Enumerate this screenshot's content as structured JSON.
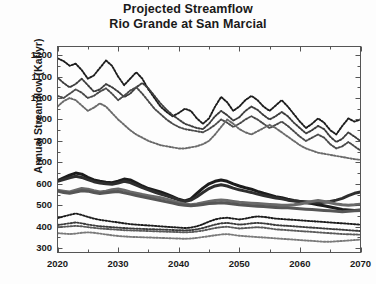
{
  "chart_data": {
    "type": "line",
    "title": "Projected Streamflow",
    "subtitle": "Rio Grande at San Marcial",
    "xlabel": "",
    "ylabel": "Annual Streamflow (Kaf/yr)",
    "xlim": [
      2020,
      2070
    ],
    "ylim": [
      280,
      1240
    ],
    "yticks": [
      300,
      400,
      500,
      600,
      700,
      800,
      900,
      1000,
      1100,
      1200
    ],
    "xticks": [
      2020,
      2030,
      2040,
      2050,
      2060,
      2070
    ],
    "xminor_step": 5,
    "grid": false,
    "legend": "none",
    "axis_frame": "box",
    "tick_direction": "in",
    "colors": {
      "background": "#fdfdfd",
      "axis": "#555555",
      "text": "#1a1a1a",
      "dark": "#1c1c1c",
      "mid_dark": "#3c3c3c",
      "mid": "#6a6a6a",
      "light": "#8e8e8e"
    },
    "x": [
      2020,
      2021,
      2022,
      2023,
      2024,
      2025,
      2026,
      2027,
      2028,
      2029,
      2030,
      2031,
      2032,
      2033,
      2034,
      2035,
      2036,
      2037,
      2038,
      2039,
      2040,
      2041,
      2042,
      2043,
      2044,
      2045,
      2046,
      2047,
      2048,
      2049,
      2050,
      2051,
      2052,
      2053,
      2054,
      2055,
      2056,
      2057,
      2058,
      2059,
      2060,
      2061,
      2062,
      2063,
      2064,
      2065,
      2066,
      2067,
      2068,
      2069,
      2070
    ],
    "series": [
      {
        "name": "upper-band-1",
        "group": "upper",
        "style": "dotted",
        "color": "#1c1c1c",
        "width": 1.9,
        "values": [
          1185,
          1172,
          1150,
          1160,
          1130,
          1090,
          1105,
          1140,
          1175,
          1150,
          1100,
          1060,
          1090,
          1120,
          1090,
          1040,
          1000,
          960,
          935,
          915,
          930,
          950,
          940,
          905,
          880,
          905,
          960,
          1005,
          980,
          940,
          960,
          990,
          1010,
          990,
          960,
          940,
          965,
          990,
          960,
          925,
          890,
          860,
          880,
          905,
          885,
          850,
          830,
          870,
          905,
          890,
          900
        ]
      },
      {
        "name": "upper-band-2",
        "group": "upper",
        "style": "dotted",
        "color": "#3c3c3c",
        "width": 1.9,
        "values": [
          1095,
          1070,
          1050,
          1065,
          1090,
          1060,
          1030,
          1040,
          1065,
          1050,
          1030,
          1005,
          1020,
          1050,
          1070,
          1045,
          1010,
          975,
          945,
          920,
          900,
          880,
          870,
          860,
          855,
          880,
          915,
          940,
          920,
          895,
          910,
          940,
          960,
          945,
          920,
          900,
          915,
          935,
          915,
          885,
          860,
          835,
          850,
          870,
          855,
          820,
          795,
          810,
          840,
          820,
          800
        ]
      },
      {
        "name": "upper-band-3",
        "group": "upper",
        "style": "dotted",
        "color": "#4a4a4a",
        "width": 1.9,
        "values": [
          1010,
          1000,
          1020,
          1040,
          1025,
          1000,
          1010,
          1030,
          1045,
          1020,
          990,
          1010,
          1035,
          1050,
          1020,
          985,
          950,
          925,
          900,
          880,
          865,
          855,
          850,
          845,
          840,
          855,
          875,
          900,
          885,
          865,
          880,
          900,
          915,
          900,
          880,
          860,
          875,
          890,
          870,
          845,
          820,
          800,
          815,
          830,
          815,
          785,
          765,
          775,
          795,
          775,
          755
        ]
      },
      {
        "name": "upper-band-4",
        "group": "upper",
        "style": "dotted",
        "color": "#6a6a6a",
        "width": 1.9,
        "values": [
          960,
          985,
          1000,
          990,
          965,
          940,
          955,
          975,
          960,
          930,
          900,
          875,
          850,
          830,
          815,
          800,
          790,
          780,
          775,
          770,
          765,
          765,
          770,
          775,
          785,
          800,
          830,
          865,
          900,
          880,
          855,
          840,
          830,
          845,
          860,
          875,
          860,
          840,
          820,
          800,
          780,
          765,
          755,
          745,
          740,
          735,
          730,
          725,
          720,
          715,
          712
        ]
      },
      {
        "name": "middle-band-1",
        "group": "middle",
        "style": "solid",
        "color": "#1c1c1c",
        "width": 3.0,
        "values": [
          615,
          628,
          640,
          650,
          645,
          630,
          618,
          612,
          608,
          605,
          612,
          622,
          618,
          605,
          590,
          578,
          570,
          562,
          552,
          540,
          528,
          520,
          530,
          555,
          580,
          600,
          612,
          618,
          612,
          600,
          590,
          582,
          575,
          565,
          556,
          548,
          540,
          535,
          528,
          522,
          518,
          512,
          508,
          502,
          498,
          492,
          486,
          480,
          478,
          476,
          478
        ]
      },
      {
        "name": "middle-band-2",
        "group": "middle",
        "style": "solid",
        "color": "#2e2e2e",
        "width": 3.0,
        "values": [
          612,
          620,
          628,
          635,
          630,
          620,
          610,
          604,
          600,
          598,
          604,
          612,
          606,
          594,
          582,
          572,
          562,
          552,
          544,
          535,
          525,
          518,
          524,
          540,
          560,
          578,
          590,
          596,
          590,
          580,
          572,
          566,
          560,
          552,
          546,
          540,
          534,
          530,
          524,
          520,
          518,
          516,
          514,
          512,
          514,
          518,
          524,
          532,
          545,
          556,
          562
        ]
      },
      {
        "name": "middle-band-3",
        "group": "middle",
        "style": "solid",
        "color": "#6a6a6a",
        "width": 3.0,
        "values": [
          570,
          566,
          562,
          570,
          578,
          575,
          568,
          562,
          566,
          572,
          576,
          570,
          562,
          556,
          550,
          545,
          540,
          535,
          528,
          520,
          512,
          506,
          502,
          506,
          512,
          518,
          522,
          525,
          522,
          518,
          514,
          512,
          510,
          508,
          506,
          504,
          502,
          500,
          500,
          502,
          506,
          512,
          518,
          522,
          518,
          512,
          506,
          502,
          500,
          502,
          505
        ]
      },
      {
        "name": "middle-band-4",
        "group": "middle",
        "style": "solid",
        "color": "#565656",
        "width": 3.0,
        "values": [
          566,
          560,
          556,
          562,
          568,
          566,
          560,
          555,
          558,
          562,
          564,
          558,
          552,
          546,
          540,
          534,
          528,
          522,
          516,
          510,
          504,
          500,
          498,
          500,
          504,
          508,
          510,
          512,
          510,
          506,
          502,
          500,
          498,
          496,
          494,
          492,
          490,
          488,
          488,
          486,
          484,
          482,
          480,
          478,
          476,
          474,
          472,
          470,
          472,
          474,
          476
        ]
      },
      {
        "name": "lower-band-1",
        "group": "lower",
        "style": "dotted",
        "color": "#1c1c1c",
        "width": 1.9,
        "values": [
          440,
          448,
          455,
          462,
          455,
          446,
          438,
          432,
          428,
          424,
          420,
          416,
          412,
          410,
          408,
          406,
          404,
          402,
          400,
          398,
          396,
          394,
          396,
          402,
          412,
          424,
          434,
          440,
          442,
          438,
          434,
          438,
          444,
          448,
          446,
          442,
          438,
          436,
          434,
          432,
          430,
          428,
          426,
          424,
          422,
          420,
          418,
          416,
          414,
          412,
          410
        ]
      },
      {
        "name": "lower-band-2",
        "group": "lower",
        "style": "dotted",
        "color": "#3c3c3c",
        "width": 1.9,
        "values": [
          408,
          412,
          416,
          420,
          416,
          410,
          406,
          402,
          400,
          398,
          396,
          394,
          392,
          391,
          390,
          389,
          388,
          387,
          386,
          385,
          384,
          383,
          384,
          388,
          394,
          402,
          410,
          416,
          418,
          414,
          410,
          412,
          416,
          418,
          416,
          412,
          408,
          406,
          404,
          402,
          400,
          398,
          396,
          394,
          392,
          390,
          388,
          386,
          384,
          382,
          380
        ]
      },
      {
        "name": "lower-band-3",
        "group": "lower",
        "style": "dotted",
        "color": "#5a5a5a",
        "width": 1.9,
        "values": [
          398,
          400,
          402,
          404,
          402,
          398,
          395,
          392,
          390,
          388,
          386,
          384,
          383,
          382,
          381,
          380,
          379,
          378,
          377,
          376,
          375,
          374,
          375,
          378,
          382,
          388,
          394,
          398,
          400,
          396,
          392,
          394,
          396,
          398,
          396,
          392,
          388,
          386,
          384,
          382,
          380,
          378,
          376,
          374,
          372,
          370,
          368,
          366,
          365,
          364,
          363
        ]
      },
      {
        "name": "lower-band-4",
        "group": "lower",
        "style": "dotted",
        "color": "#7a7a7a",
        "width": 1.9,
        "values": [
          370,
          368,
          366,
          368,
          372,
          374,
          372,
          368,
          364,
          360,
          357,
          355,
          353,
          352,
          351,
          350,
          349,
          348,
          347,
          346,
          345,
          344,
          345,
          348,
          352,
          356,
          360,
          364,
          366,
          362,
          358,
          356,
          354,
          352,
          350,
          348,
          346,
          344,
          342,
          340,
          338,
          336,
          334,
          332,
          330,
          330,
          332,
          334,
          336,
          338,
          340
        ]
      }
    ]
  }
}
